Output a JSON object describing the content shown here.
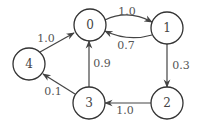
{
  "diagram": {
    "type": "directed-weighted-graph",
    "nodes": [
      {
        "id": "0",
        "label": "0",
        "x": 90,
        "y": 25
      },
      {
        "id": "1",
        "label": "1",
        "x": 167,
        "y": 28
      },
      {
        "id": "2",
        "label": "2",
        "x": 167,
        "y": 103
      },
      {
        "id": "3",
        "label": "3",
        "x": 89,
        "y": 103
      },
      {
        "id": "4",
        "label": "4",
        "x": 29,
        "y": 64
      }
    ],
    "edges": [
      {
        "from": "0",
        "to": "1",
        "weight": "1.0"
      },
      {
        "from": "1",
        "to": "0",
        "weight": "0.7"
      },
      {
        "from": "1",
        "to": "2",
        "weight": "0.3"
      },
      {
        "from": "2",
        "to": "3",
        "weight": "1.0"
      },
      {
        "from": "3",
        "to": "0",
        "weight": "0.9"
      },
      {
        "from": "3",
        "to": "4",
        "weight": "0.1"
      },
      {
        "from": "4",
        "to": "0",
        "weight": "1.0"
      }
    ],
    "colors": {
      "stroke": "#333333",
      "text": "#444444",
      "background": "#ffffff"
    }
  }
}
